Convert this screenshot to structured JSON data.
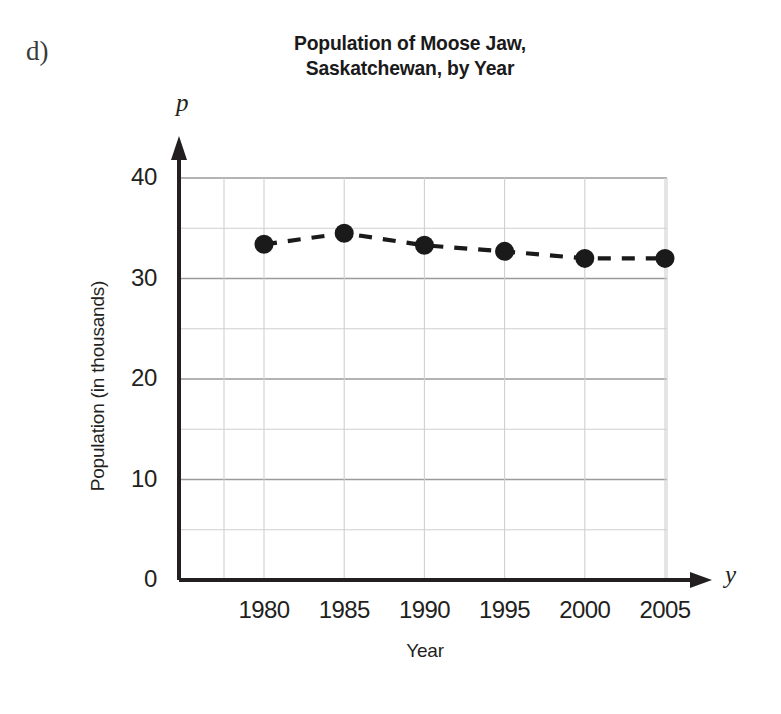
{
  "part_label": "d)",
  "title_lines": [
    "Population of Moose Jaw,",
    "Saskatchewan, by Year"
  ],
  "axis_variables": {
    "vertical": "p",
    "horizontal": "y"
  },
  "chart_data": {
    "type": "line",
    "title": "Population of Moose Jaw, Saskatchewan, by Year",
    "xlabel": "Year",
    "ylabel": "Population (in thousands)",
    "x": [
      1980,
      1985,
      1990,
      1995,
      2000,
      2005
    ],
    "values": [
      33.4,
      34.5,
      33.3,
      32.7,
      32.0,
      32.0
    ],
    "series": [
      {
        "name": "Population of Moose Jaw",
        "values": [
          33.4,
          34.5,
          33.3,
          32.7,
          32.0,
          32.0
        ]
      }
    ],
    "xtick_labels": [
      "1980",
      "1985",
      "1990",
      "1995",
      "2000",
      "2005"
    ],
    "ytick_labels": [
      "0",
      "10",
      "20",
      "30",
      "40"
    ],
    "ytick_values": [
      0,
      10,
      20,
      30,
      40
    ],
    "yminor_values": [
      5,
      15,
      25,
      35
    ],
    "xlim": [
      1975,
      2007.5
    ],
    "ylim": [
      0,
      42
    ],
    "grid": true,
    "legend": "none",
    "line_style": "dashed",
    "marker": "filled-circle",
    "colors": {
      "series": "#1a1a1a",
      "axis": "#231f20",
      "grid_major": "#9a9a9a",
      "grid_minor": "#cfcfcf",
      "text": "#231f20",
      "background": "#ffffff"
    }
  }
}
